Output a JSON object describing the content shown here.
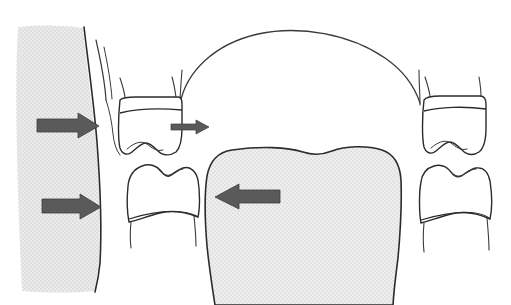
{
  "figure": {
    "type": "line-drawing"
  },
  "colors": {
    "background": "#ffffff",
    "outline": "#2b2b2b",
    "tissue_fill": "#e3e3e3",
    "tissue_fill_alt": "#e7e7e7",
    "arrow_fill": "#5a5a5a",
    "arrow_stroke": "#3d3d3d"
  },
  "elements": {
    "cheek_band": {
      "label": "cheek-musculature",
      "side": "left",
      "fill": "#e3e3e3"
    },
    "tongue": {
      "label": "tongue",
      "position": "center-lower",
      "fill": "#e7e7e7"
    },
    "arch_curve": {
      "label": "dental-arch-outline",
      "position": "top-center"
    },
    "teeth": [
      {
        "name": "upper-left-molar",
        "jaw": "maxillary",
        "side": "left"
      },
      {
        "name": "lower-left-molar",
        "jaw": "mandibular",
        "side": "left"
      },
      {
        "name": "upper-right-molar",
        "jaw": "maxillary",
        "side": "right"
      },
      {
        "name": "lower-right-molar",
        "jaw": "mandibular",
        "side": "right"
      }
    ],
    "arrows": [
      {
        "name": "cheek-pressure-arrow-upper",
        "direction": "right",
        "size": "large"
      },
      {
        "name": "cheek-pressure-arrow-lower",
        "direction": "right",
        "size": "large"
      },
      {
        "name": "buccal-pressure-arrow-small",
        "direction": "right",
        "size": "small"
      },
      {
        "name": "tongue-pressure-arrow",
        "direction": "left",
        "size": "large"
      }
    ]
  }
}
